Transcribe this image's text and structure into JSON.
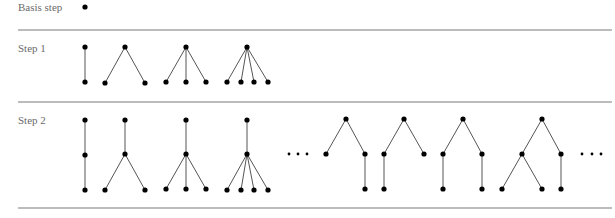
{
  "figure": {
    "rows": [
      {
        "label": "Basis step",
        "label_pos": [
          18,
          11
        ],
        "trees": [
          {
            "nodes": [
              [
                85,
                7
              ]
            ],
            "edges": []
          }
        ],
        "ellipses": []
      },
      {
        "label": "Step 1",
        "label_pos": [
          18,
          52
        ],
        "trees": [
          {
            "nodes": [
              [
                85,
                47
              ],
              [
                85,
                82
              ]
            ],
            "edges": [
              [
                0,
                1
              ]
            ]
          },
          {
            "nodes": [
              [
                125,
                47
              ],
              [
                105,
                83
              ],
              [
                145,
                83
              ]
            ],
            "edges": [
              [
                0,
                1
              ],
              [
                0,
                2
              ]
            ]
          },
          {
            "nodes": [
              [
                186,
                47
              ],
              [
                166,
                82
              ],
              [
                186,
                82
              ],
              [
                206,
                82
              ]
            ],
            "edges": [
              [
                0,
                1
              ],
              [
                0,
                2
              ],
              [
                0,
                3
              ]
            ]
          },
          {
            "nodes": [
              [
                247,
                47
              ],
              [
                227,
                82
              ],
              [
                241,
                82
              ],
              [
                254,
                82
              ],
              [
                268,
                82
              ]
            ],
            "edges": [
              [
                0,
                1
              ],
              [
                0,
                2
              ],
              [
                0,
                3
              ],
              [
                0,
                4
              ]
            ]
          }
        ],
        "ellipses": []
      },
      {
        "label": "Step 2",
        "label_pos": [
          18,
          124
        ],
        "trees": [
          {
            "nodes": [
              [
                85,
                120
              ],
              [
                85,
                155
              ],
              [
                85,
                190
              ]
            ],
            "edges": [
              [
                0,
                1
              ],
              [
                1,
                2
              ]
            ]
          },
          {
            "nodes": [
              [
                125,
                120
              ],
              [
                125,
                154
              ],
              [
                105,
                190
              ],
              [
                145,
                190
              ]
            ],
            "edges": [
              [
                0,
                1
              ],
              [
                1,
                2
              ],
              [
                1,
                3
              ]
            ]
          },
          {
            "nodes": [
              [
                186,
                120
              ],
              [
                186,
                154
              ],
              [
                166,
                189
              ],
              [
                186,
                189
              ],
              [
                206,
                189
              ]
            ],
            "edges": [
              [
                0,
                1
              ],
              [
                1,
                2
              ],
              [
                1,
                3
              ],
              [
                1,
                4
              ]
            ]
          },
          {
            "nodes": [
              [
                247,
                120
              ],
              [
                247,
                154
              ],
              [
                227,
                190
              ],
              [
                241,
                190
              ],
              [
                254,
                190
              ],
              [
                268,
                190
              ]
            ],
            "edges": [
              [
                0,
                1
              ],
              [
                1,
                2
              ],
              [
                1,
                3
              ],
              [
                1,
                4
              ],
              [
                1,
                5
              ]
            ]
          },
          {
            "nodes": [
              [
                346,
                119
              ],
              [
                326,
                154
              ],
              [
                365,
                154
              ],
              [
                365,
                189
              ]
            ],
            "edges": [
              [
                0,
                1
              ],
              [
                0,
                2
              ],
              [
                2,
                3
              ]
            ]
          },
          {
            "nodes": [
              [
                404,
                119
              ],
              [
                384,
                154
              ],
              [
                424,
                154
              ],
              [
                384,
                189
              ]
            ],
            "edges": [
              [
                0,
                1
              ],
              [
                0,
                2
              ],
              [
                1,
                3
              ]
            ]
          },
          {
            "nodes": [
              [
                463,
                119
              ],
              [
                443,
                154
              ],
              [
                482,
                154
              ],
              [
                443,
                189
              ],
              [
                482,
                189
              ]
            ],
            "edges": [
              [
                0,
                1
              ],
              [
                0,
                2
              ],
              [
                1,
                3
              ],
              [
                2,
                4
              ]
            ]
          },
          {
            "nodes": [
              [
                542,
                119
              ],
              [
                522,
                154
              ],
              [
                561,
                154
              ],
              [
                502,
                189
              ],
              [
                542,
                189
              ],
              [
                561,
                189
              ]
            ],
            "edges": [
              [
                0,
                1
              ],
              [
                0,
                2
              ],
              [
                1,
                3
              ],
              [
                1,
                4
              ],
              [
                2,
                5
              ]
            ]
          }
        ],
        "ellipses": [
          {
            "points": [
              [
                289,
                154
              ],
              [
                298,
                154
              ],
              [
                307,
                154
              ]
            ]
          },
          {
            "points": [
              [
                582,
                154
              ],
              [
                592,
                154
              ],
              [
                601,
                154
              ]
            ]
          }
        ]
      }
    ],
    "separators": [
      {
        "y": 30,
        "x1": 18,
        "x2": 612
      },
      {
        "y": 102,
        "x1": 18,
        "x2": 612
      },
      {
        "y": 208,
        "x1": 18,
        "x2": 612
      }
    ],
    "node_radius": 2.6,
    "ellipsis_dot_radius": 1.4,
    "colors": {
      "node": "#000000",
      "edge": "#555555",
      "separator": "#7a7a7a",
      "label": "#6b6b6b"
    }
  }
}
